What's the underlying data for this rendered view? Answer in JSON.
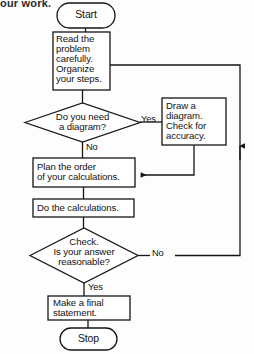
{
  "page": {
    "caption_fragment": "our work.",
    "background_color": "#fdfdfd",
    "ink_color": "#161616",
    "width": 254,
    "height": 354
  },
  "flowchart": {
    "title": "Problem solving flowchart",
    "nodes": {
      "start": {
        "label": "Start",
        "shape": "terminator"
      },
      "read_problem": {
        "label": "Read the\nproblem\ncarefully.\nOrganize\nyour steps.",
        "shape": "process"
      },
      "need_diagram": {
        "label": "Do you need\na diagram?",
        "shape": "decision"
      },
      "draw_diagram": {
        "label": "Draw a\ndiagram.\nCheck for\naccuracy.",
        "shape": "process"
      },
      "plan_order": {
        "label": "Plan the order\nof your calculations.",
        "shape": "process"
      },
      "do_calculations": {
        "label": "Do the calculations.",
        "shape": "process"
      },
      "check_answer": {
        "label": "Check.\nIs your answer\nreasonable?",
        "shape": "decision"
      },
      "final_statement": {
        "label": "Make a final\nstatement.",
        "shape": "process"
      },
      "stop": {
        "label": "Stop",
        "shape": "terminator"
      }
    },
    "branch_labels": {
      "diagram_yes": "Yes",
      "diagram_no": "No",
      "check_no": "No",
      "check_yes": "Yes"
    }
  }
}
